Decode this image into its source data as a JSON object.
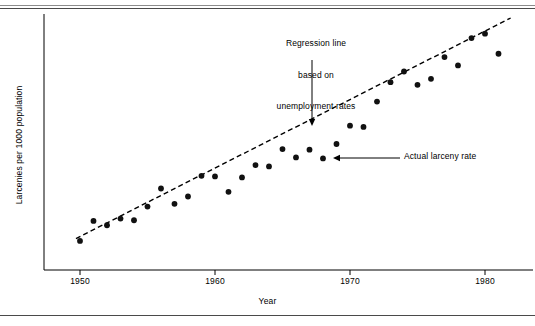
{
  "figure": {
    "top_rule": "",
    "bottom_rule": ""
  },
  "annotations": {
    "regression": {
      "line1": "Regression line",
      "line2": "based on",
      "line3": "unemployment rates"
    },
    "actual": {
      "label": "Actual larceny rate"
    }
  },
  "colors": {
    "ink": "#000000",
    "rule": "#4a4a4a",
    "point": "#111111"
  },
  "chart_data": {
    "type": "scatter",
    "title": "",
    "xlabel": "Year",
    "ylabel": "Larcenies per 1000 population",
    "xlim": [
      1949,
      1982
    ],
    "ylim": [
      0,
      10
    ],
    "grid": false,
    "legend": "none",
    "xticks": [
      1950,
      1960,
      1970,
      1980
    ],
    "xtick_labels": [
      "1950",
      "1960",
      "1970",
      "1980"
    ],
    "yticks": [],
    "ytick_labels": [],
    "series": [
      {
        "name": "Actual larceny rate",
        "type": "scatter",
        "marker": "filled-circle",
        "x": [
          1950,
          1951,
          1952,
          1953,
          1954,
          1955,
          1956,
          1957,
          1958,
          1959,
          1960,
          1961,
          1962,
          1963,
          1964,
          1965,
          1966,
          1967,
          1968,
          1969,
          1970,
          1971,
          1972,
          1973,
          1974,
          1975,
          1976,
          1977,
          1978,
          1979,
          1980,
          1981
        ],
        "y": [
          0.45,
          1.05,
          0.92,
          1.12,
          1.07,
          1.48,
          2.02,
          1.56,
          1.78,
          2.4,
          2.38,
          1.92,
          2.35,
          2.72,
          2.68,
          3.2,
          2.95,
          3.18,
          2.92,
          3.35,
          3.9,
          3.86,
          4.62,
          5.2,
          5.52,
          5.12,
          5.3,
          5.95,
          5.7,
          6.52,
          6.65,
          6.05
        ]
      },
      {
        "name": "Regression line based on unemployment rates",
        "type": "line",
        "style": "dashed",
        "x": [
          1949.7,
          1981.9
        ],
        "y": [
          0.52,
          7.12
        ]
      }
    ],
    "annotations": [
      {
        "text": "Regression line based on unemployment rates",
        "arrow": "down",
        "points_to_x": 1968.5,
        "points_to_y": 4.05
      },
      {
        "text": "Actual larceny rate",
        "arrow": "left",
        "points_to_x": 1968,
        "points_to_y": 2.92
      }
    ]
  }
}
